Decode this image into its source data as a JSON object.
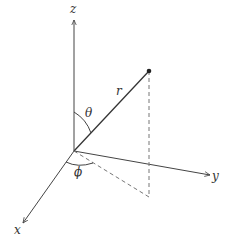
{
  "diagram": {
    "colors": {
      "line": "#444444",
      "dashed": "#777777",
      "text": "#333333",
      "background": "#ffffff"
    },
    "origin": [
      74,
      151
    ],
    "axes": {
      "z": {
        "label": "z",
        "tip": [
          74,
          20
        ],
        "label_pos": [
          70,
          3
        ]
      },
      "y": {
        "label": "y",
        "tip": [
          210,
          175
        ],
        "label_pos": [
          212,
          170
        ]
      },
      "x": {
        "label": "x",
        "tip": [
          23,
          223
        ],
        "label_pos": [
          14,
          224
        ]
      }
    },
    "point": [
      149,
      71
    ],
    "projection": [
      149,
      197
    ],
    "labels": {
      "r": {
        "text": "r",
        "pos": [
          116,
          85
        ]
      },
      "theta": {
        "text": "θ",
        "pos": [
          85,
          107
        ]
      },
      "phi": {
        "text": "ϕ",
        "pos": [
          74,
          166
        ]
      }
    }
  }
}
